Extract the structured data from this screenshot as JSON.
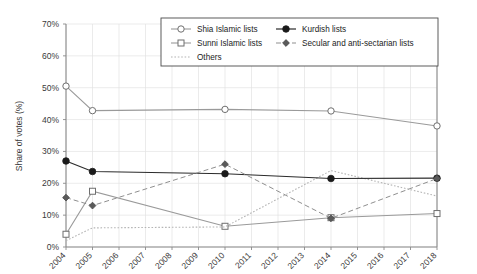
{
  "chart_data": {
    "type": "line",
    "title": "",
    "xlabel": "",
    "ylabel": "Share of votes (%)",
    "x": [
      2004,
      2005,
      2006,
      2007,
      2008,
      2009,
      2010,
      2011,
      2012,
      2013,
      2014,
      2015,
      2016,
      2017,
      2018
    ],
    "categories": [
      "2004",
      "2005",
      "2006",
      "2007",
      "2008",
      "2009",
      "2010",
      "2011",
      "2012",
      "2013",
      "2014",
      "2015",
      "2016",
      "2017",
      "2018"
    ],
    "xlim": [
      2004,
      2018
    ],
    "ylim": [
      0,
      70
    ],
    "ytick_labels": [
      "0%",
      "10%",
      "20%",
      "30%",
      "40%",
      "50%",
      "60%",
      "70%"
    ],
    "ytick_values": [
      0,
      10,
      20,
      30,
      40,
      50,
      60,
      70
    ],
    "grid": true,
    "legend_position": "top-center",
    "series": [
      {
        "name": "Shia Islamic lists",
        "marker": "open-circle",
        "line": "solid",
        "color": "#9a9a9a",
        "points": [
          {
            "x": 2004,
            "y": 50.5
          },
          {
            "x": 2005,
            "y": 42.8
          },
          {
            "x": 2010,
            "y": 43.2
          },
          {
            "x": 2014,
            "y": 42.7
          },
          {
            "x": 2018,
            "y": 38.0
          }
        ]
      },
      {
        "name": "Sunni Islamic lists",
        "marker": "open-square",
        "line": "solid",
        "color": "#9a9a9a",
        "points": [
          {
            "x": 2004,
            "y": 4.0
          },
          {
            "x": 2005,
            "y": 17.5
          },
          {
            "x": 2010,
            "y": 6.5
          },
          {
            "x": 2014,
            "y": 9.2
          },
          {
            "x": 2018,
            "y": 10.5
          }
        ]
      },
      {
        "name": "Others",
        "marker": "none",
        "line": "dotted",
        "color": "#b4b4b4",
        "points": [
          {
            "x": 2004,
            "y": 2.0
          },
          {
            "x": 2005,
            "y": 6.0
          },
          {
            "x": 2010,
            "y": 6.3
          },
          {
            "x": 2014,
            "y": 24.0
          },
          {
            "x": 2018,
            "y": 16.0
          }
        ]
      },
      {
        "name": "Kurdish lists",
        "marker": "filled-circle",
        "line": "solid",
        "color": "#1a1a1a",
        "points": [
          {
            "x": 2004,
            "y": 27.0
          },
          {
            "x": 2005,
            "y": 23.7
          },
          {
            "x": 2010,
            "y": 23.0
          },
          {
            "x": 2014,
            "y": 21.5
          },
          {
            "x": 2018,
            "y": 21.6
          }
        ]
      },
      {
        "name": "Secular and anti-sectarian lists",
        "marker": "filled-diamond",
        "line": "dashed",
        "color": "#8f8f8f",
        "points": [
          {
            "x": 2004,
            "y": 15.5
          },
          {
            "x": 2005,
            "y": 13.0
          },
          {
            "x": 2010,
            "y": 26.0
          },
          {
            "x": 2014,
            "y": 9.0
          },
          {
            "x": 2018,
            "y": 21.5
          }
        ]
      }
    ]
  },
  "legend": {
    "entries": [
      {
        "label": "Shia Islamic lists"
      },
      {
        "label": "Sunni Islamic lists"
      },
      {
        "label": "Others"
      },
      {
        "label": "Kurdish lists"
      },
      {
        "label": "Secular and anti-sectarian lists"
      }
    ]
  },
  "axis": {
    "y_title": "Share of votes (%)",
    "y_ticks": [
      "70%",
      "60%",
      "50%",
      "40%",
      "30%",
      "20%",
      "10%",
      "0%"
    ],
    "x_ticks": [
      "2004",
      "2005",
      "2006",
      "2007",
      "2008",
      "2009",
      "2010",
      "2011",
      "2012",
      "2013",
      "2014",
      "2015",
      "2016",
      "2017",
      "2018"
    ]
  }
}
